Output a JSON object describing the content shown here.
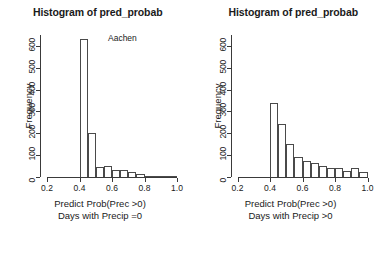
{
  "figure": {
    "background": "#ffffff",
    "foreground": "#1a1a1a"
  },
  "panels": [
    {
      "name": "left",
      "title": "Histogram of pred_probab",
      "ylabel": "Frequency",
      "xlabel_line1": "Predict Prob(Prec >0)",
      "xlabel_line2": "Days with Precip =0",
      "annotation": "Aachen"
    },
    {
      "name": "right",
      "title": "Histogram of pred_probab",
      "ylabel": "Frequency",
      "xlabel_line1": "Predict Prob(Prec >0)",
      "xlabel_line2": "Days with Precip >0",
      "annotation": ""
    }
  ],
  "chart_data": [
    {
      "type": "bar",
      "title": "Histogram of pred_probab",
      "subtitle": "Aachen",
      "xlabel": "Predict Prob(Prec >0) Days with Precip =0",
      "ylabel": "Frequency",
      "xlim": [
        0.2,
        1.0
      ],
      "ylim": [
        0,
        650
      ],
      "xticks": [
        0.2,
        0.4,
        0.6,
        0.8,
        1.0
      ],
      "yticks": [
        0,
        100,
        200,
        300,
        400,
        500,
        600
      ],
      "grid": false,
      "legend": null,
      "bin_width": 0.05,
      "bin_edges": [
        0.4,
        0.45,
        0.5,
        0.55,
        0.6,
        0.65,
        0.7,
        0.75,
        0.8,
        0.85,
        0.9,
        0.95,
        1.0
      ],
      "categories": [
        "0.40-0.45",
        "0.45-0.50",
        "0.50-0.55",
        "0.55-0.60",
        "0.60-0.65",
        "0.65-0.70",
        "0.70-0.75",
        "0.75-0.80",
        "0.80-0.85",
        "0.85-0.90",
        "0.90-0.95",
        "0.95-1.00"
      ],
      "values": [
        630,
        200,
        48,
        50,
        33,
        30,
        24,
        14,
        5,
        4,
        4,
        5
      ]
    },
    {
      "type": "bar",
      "title": "Histogram of pred_probab",
      "subtitle": "",
      "xlabel": "Predict Prob(Prec >0) Days with Precip >0",
      "ylabel": "Frequency",
      "xlim": [
        0.2,
        1.0
      ],
      "ylim": [
        0,
        650
      ],
      "xticks": [
        0.2,
        0.4,
        0.6,
        0.8,
        1.0
      ],
      "yticks": [
        0,
        100,
        200,
        300,
        400,
        500,
        600
      ],
      "grid": false,
      "legend": null,
      "bin_width": 0.05,
      "bin_edges": [
        0.4,
        0.45,
        0.5,
        0.55,
        0.6,
        0.65,
        0.7,
        0.75,
        0.8,
        0.85,
        0.9,
        0.95,
        1.0
      ],
      "categories": [
        "0.40-0.45",
        "0.45-0.50",
        "0.50-0.55",
        "0.55-0.60",
        "0.60-0.65",
        "0.65-0.70",
        "0.70-0.75",
        "0.75-0.80",
        "0.80-0.85",
        "0.85-0.90",
        "0.90-0.95",
        "0.95-1.00"
      ],
      "values": [
        338,
        242,
        150,
        90,
        72,
        65,
        52,
        42,
        40,
        26,
        42,
        24
      ]
    }
  ]
}
